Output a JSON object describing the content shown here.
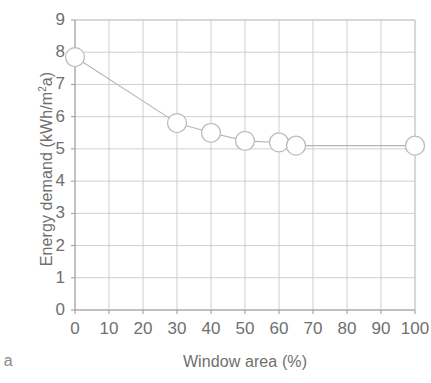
{
  "chart_data": {
    "type": "line",
    "title": "",
    "xlabel": "Window area (%)",
    "ylabel": "Energy demand (kWh/m²a)",
    "ylabel_main": "Energy demand (kWh/m",
    "ylabel_sup": "2",
    "ylabel_tail": "a)",
    "x": [
      0,
      30,
      40,
      50,
      60,
      65,
      100
    ],
    "values": [
      7.85,
      5.8,
      5.5,
      5.25,
      5.2,
      5.1,
      5.1
    ],
    "series": [
      {
        "name": "Energy demand",
        "x": [
          0,
          30,
          40,
          50,
          60,
          65,
          100
        ],
        "values": [
          7.85,
          5.8,
          5.5,
          5.25,
          5.2,
          5.1,
          5.1
        ]
      }
    ],
    "xlim": [
      0,
      100
    ],
    "ylim": [
      0,
      9
    ],
    "xticks": [
      0,
      10,
      20,
      30,
      40,
      50,
      60,
      70,
      80,
      90,
      100
    ],
    "xtick_labels": [
      "0",
      "10",
      "20",
      "30",
      "40",
      "50",
      "60",
      "70",
      "80",
      "90",
      "100"
    ],
    "yticks": [
      0,
      1,
      2,
      3,
      4,
      5,
      6,
      7,
      8,
      9
    ],
    "ytick_labels": [
      "0",
      "1",
      "2",
      "3",
      "4",
      "5",
      "6",
      "7",
      "8",
      "9"
    ],
    "grid": true,
    "grid_color": "#c9c9c9",
    "legend": "none",
    "line_color": "#b4b4b4",
    "marker": "open-circle",
    "marker_edge_color": "#bdbdbd",
    "marker_fill_color": "#ffffff",
    "axis_color": "#9a9a9a",
    "text_color": "#6f6f6f"
  },
  "annotations": {
    "corner_fragment": ") a"
  }
}
